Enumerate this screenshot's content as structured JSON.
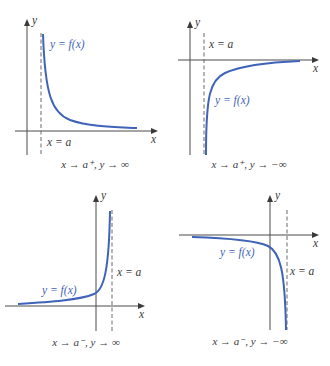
{
  "colors": {
    "curve": "#3f63b8",
    "axis": "#4a4a4a",
    "asymptote": "#6a6a6a",
    "text": "#3a3a3a"
  },
  "panels": [
    {
      "id": "top-left",
      "x_label": "x",
      "y_label": "y",
      "asymptote_label": "x = a",
      "curve_label": "y = f(x)",
      "caption": "x → a⁺, y → ∞"
    },
    {
      "id": "top-right",
      "x_label": "x",
      "y_label": "y",
      "asymptote_label": "x = a",
      "curve_label": "y = f(x)",
      "caption": "x → a⁺, y → −∞"
    },
    {
      "id": "bottom-left",
      "x_label": "x",
      "y_label": "y",
      "asymptote_label": "x = a",
      "curve_label": "y = f(x)",
      "caption": "x → a⁻, y → ∞"
    },
    {
      "id": "bottom-right",
      "x_label": "x",
      "y_label": "y",
      "asymptote_label": "x = a",
      "curve_label": "y = f(x)",
      "caption": "x → a⁻, y → −∞"
    }
  ]
}
